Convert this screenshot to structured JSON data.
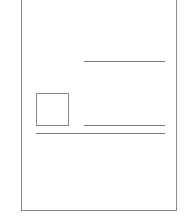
{
  "diagram": {
    "type": "page-layout-wireframe",
    "page": {
      "x": 21,
      "y": -2,
      "width": 156,
      "height": 213,
      "border_color": "#8a8a8a"
    },
    "elements": [
      {
        "kind": "text-line",
        "label": "header-line",
        "x": 84,
        "y": 61,
        "width": 81
      },
      {
        "kind": "image-placeholder",
        "label": "image-box",
        "x": 36,
        "y": 93,
        "width": 32,
        "height": 32
      },
      {
        "kind": "text-line",
        "label": "caption-line",
        "x": 84,
        "y": 125,
        "width": 81
      },
      {
        "kind": "text-line",
        "label": "full-width-line",
        "x": 36,
        "y": 133,
        "width": 129
      }
    ],
    "line_color": "#7a7a7a"
  }
}
